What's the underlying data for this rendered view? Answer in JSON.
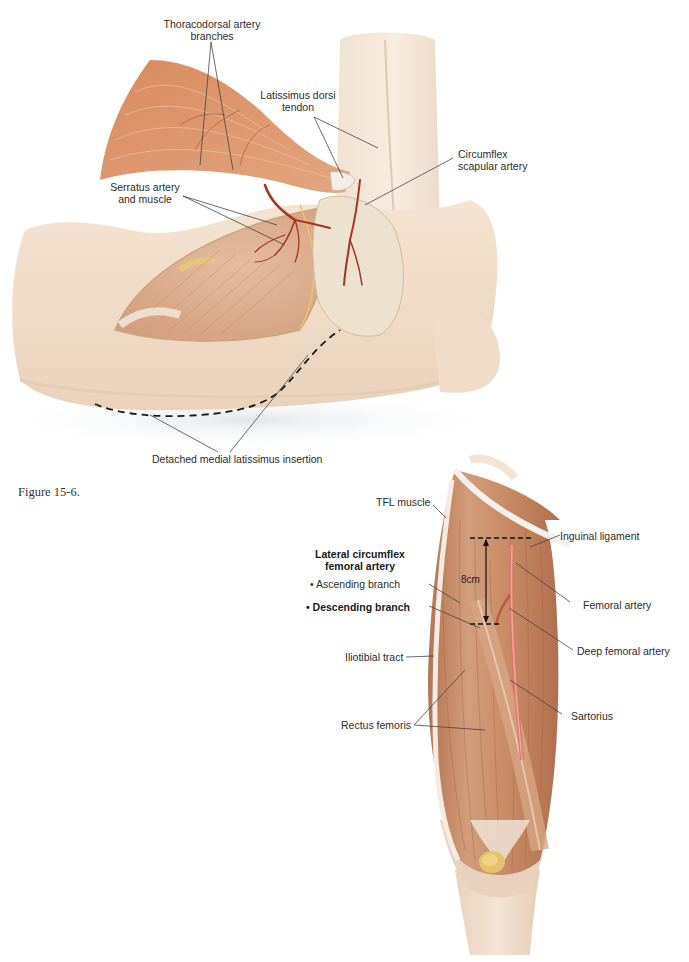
{
  "page": {
    "caption": "Figure 15-6."
  },
  "figure_top": {
    "title": "Latissimus dorsi flap dissection",
    "labels": {
      "thoracodorsal_line1": "Thoracodorsal artery",
      "thoracodorsal_line2": "branches",
      "latissimus_line1": "Latissimus dorsi",
      "latissimus_line2": "tendon",
      "circumflex_line1": "Circumflex",
      "circumflex_line2": "scapular artery",
      "serratus_line1": "Serratus artery",
      "serratus_line2": "and muscle",
      "detached": "Detached medial latissimus insertion"
    },
    "colors": {
      "muscle": "#d9946c",
      "skin": "#f0dcc6",
      "artery": "#a8341e",
      "leader_line": "#444444"
    }
  },
  "figure_bottom": {
    "title": "Anterolateral thigh anatomy",
    "labels": {
      "tfl": "TFL muscle",
      "inguinal": "Inguinal ligament",
      "lcfa_line1": "Lateral circumflex",
      "lcfa_line2": "femoral artery",
      "ascending": "• Ascending branch",
      "descending": "• Descending branch",
      "femoral": "Femoral artery",
      "deep_femoral": "Deep femoral artery",
      "iliotibial": "Iliotibial tract",
      "sartorius": "Sartorius",
      "rectus": "Rectus femoris"
    },
    "measurement": "8cm",
    "colors": {
      "muscle": "#c98a62",
      "tendon": "#f2e6da",
      "artery": "#d9786a",
      "patella": "#e6c26a"
    }
  }
}
